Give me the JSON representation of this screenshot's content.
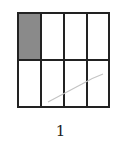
{
  "figure": {
    "label": "1",
    "grid": {
      "rows": 2,
      "cols": 4,
      "shaded_cells": [
        [
          0,
          0
        ]
      ],
      "shade_color": "#8a8a8a",
      "line_color": "#222222"
    },
    "annotation": "faint pencil stroke across lower-right cells"
  }
}
